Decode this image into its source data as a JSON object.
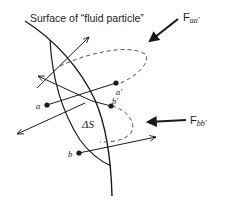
{
  "diagram": {
    "title": "Surface of “fluid particle”",
    "labels": {
      "surface": "Surface of “fluid particle”",
      "force_aa_base": "F",
      "force_aa_sub": "aa′",
      "force_bb_base": "F",
      "force_bb_sub": "bb′",
      "delta_s": "ΔS",
      "point_a": "a",
      "point_a_prime": "a′",
      "point_b": "b",
      "point_b_prime": "b′"
    },
    "colors": {
      "stroke": "#1a1a1a",
      "background": "#ffffff"
    }
  }
}
